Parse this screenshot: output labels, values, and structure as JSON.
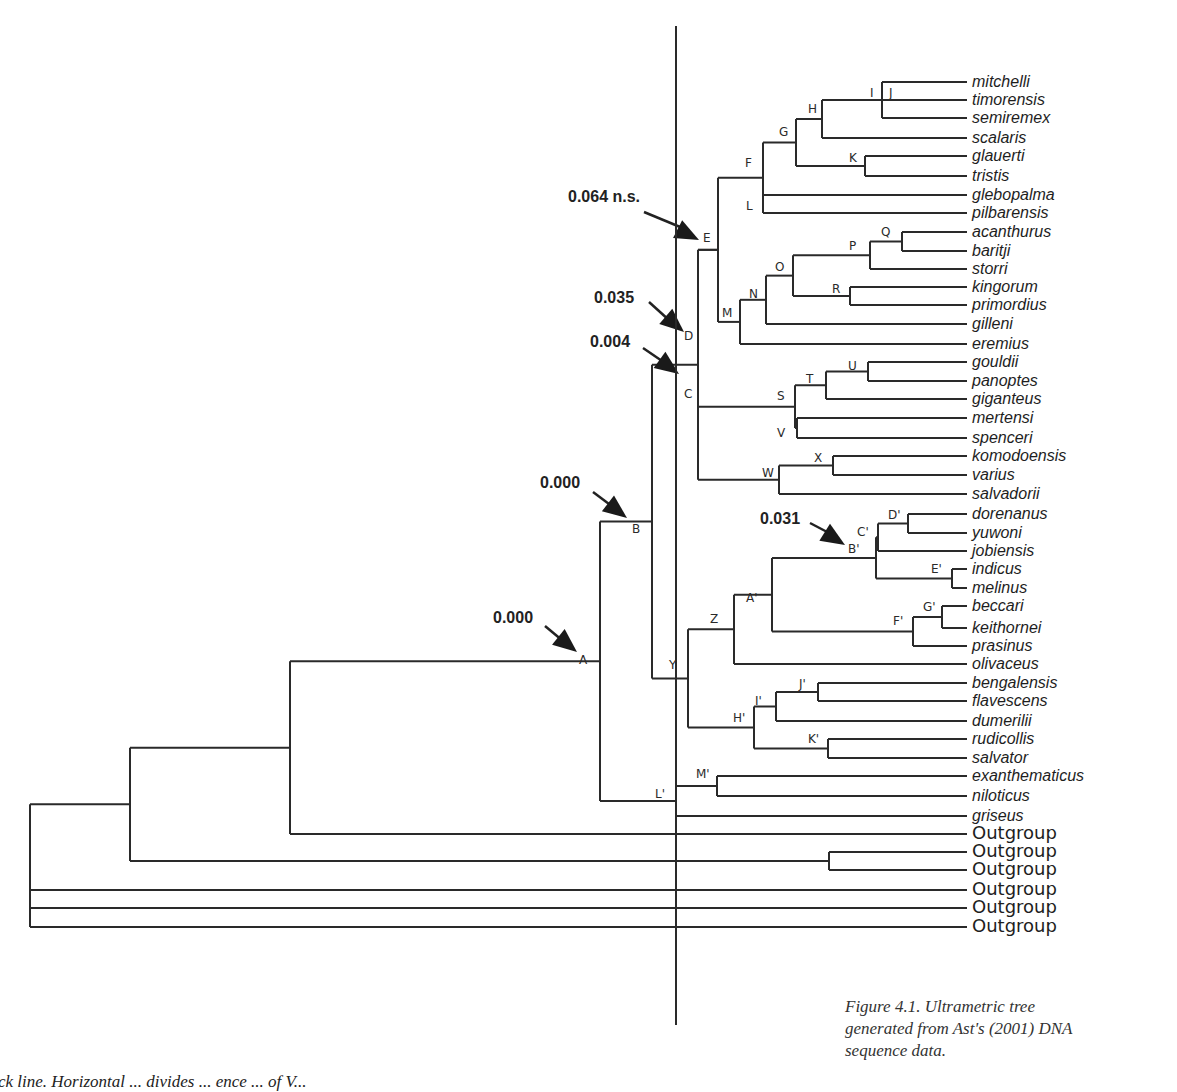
{
  "figure": {
    "caption": "Figure 4.1. Ultrametric tree generated from Ast's (2001) DNA sequence data.",
    "caption_lines": [
      "Figure 4.1. Ultrametric tree",
      "generated from Ast's (2001) DNA",
      "sequence data."
    ],
    "bottom_text": "ck line. Horizontal ... divides ... ence ... of V..."
  },
  "tree": {
    "leaf_x_end": 967,
    "label_x": 972,
    "cut_line": {
      "x": 676,
      "y1": 26,
      "y2": 1025
    },
    "leaves": [
      {
        "id": "mitchelli",
        "label": "mitchelli",
        "y": 82
      },
      {
        "id": "timorensis",
        "label": "timorensis",
        "y": 100
      },
      {
        "id": "semiremex",
        "label": "semiremex",
        "y": 118
      },
      {
        "id": "scalaris",
        "label": "scalaris",
        "y": 138
      },
      {
        "id": "glauerti",
        "label": "glauerti",
        "y": 156
      },
      {
        "id": "tristis",
        "label": "tristis",
        "y": 176
      },
      {
        "id": "glebopalma",
        "label": "glebopalma",
        "y": 195
      },
      {
        "id": "pilbarensis",
        "label": "pilbarensis",
        "y": 213
      },
      {
        "id": "acanthurus",
        "label": "acanthurus",
        "y": 232
      },
      {
        "id": "baritji",
        "label": "baritji",
        "y": 251
      },
      {
        "id": "storri",
        "label": "storri",
        "y": 269
      },
      {
        "id": "kingorum",
        "label": "kingorum",
        "y": 287
      },
      {
        "id": "primordius",
        "label": "primordius",
        "y": 305
      },
      {
        "id": "gilleni",
        "label": "gilleni",
        "y": 324
      },
      {
        "id": "eremius",
        "label": "eremius",
        "y": 344
      },
      {
        "id": "gouldii",
        "label": "gouldii",
        "y": 362
      },
      {
        "id": "panoptes",
        "label": "panoptes",
        "y": 381
      },
      {
        "id": "giganteus",
        "label": "giganteus",
        "y": 399
      },
      {
        "id": "mertensi",
        "label": "mertensi",
        "y": 418
      },
      {
        "id": "spenceri",
        "label": "spenceri",
        "y": 438
      },
      {
        "id": "komodoensis",
        "label": "komodoensis",
        "y": 456
      },
      {
        "id": "varius",
        "label": "varius",
        "y": 475
      },
      {
        "id": "salvadorii",
        "label": "salvadorii",
        "y": 494
      },
      {
        "id": "dorenanus",
        "label": "dorenanus",
        "y": 514
      },
      {
        "id": "yuwoni",
        "label": "yuwoni",
        "y": 533
      },
      {
        "id": "jobiensis",
        "label": "jobiensis",
        "y": 551
      },
      {
        "id": "indicus",
        "label": "indicus",
        "y": 569
      },
      {
        "id": "melinus",
        "label": "melinus",
        "y": 588
      },
      {
        "id": "beccari",
        "label": "beccari",
        "y": 606
      },
      {
        "id": "keithornei",
        "label": "keithornei",
        "y": 628
      },
      {
        "id": "prasinus",
        "label": "prasinus",
        "y": 646
      },
      {
        "id": "olivaceus",
        "label": "olivaceus",
        "y": 664
      },
      {
        "id": "bengalensis",
        "label": "bengalensis",
        "y": 683
      },
      {
        "id": "flavescens",
        "label": "flavescens",
        "y": 701
      },
      {
        "id": "dumerilii",
        "label": "dumerilii",
        "y": 721
      },
      {
        "id": "rudicollis",
        "label": "rudicollis",
        "y": 739
      },
      {
        "id": "salvator",
        "label": "salvator",
        "y": 758
      },
      {
        "id": "exanthematicus",
        "label": "exanthematicus",
        "y": 776
      },
      {
        "id": "niloticus",
        "label": "niloticus",
        "y": 796
      },
      {
        "id": "griseus",
        "label": "griseus",
        "y": 816
      },
      {
        "id": "og1",
        "label": "Outgroup",
        "y": 834,
        "outgroup": true
      },
      {
        "id": "og2",
        "label": "Outgroup",
        "y": 852,
        "outgroup": true
      },
      {
        "id": "og3",
        "label": "Outgroup",
        "y": 870,
        "outgroup": true
      },
      {
        "id": "og4",
        "label": "Outgroup",
        "y": 890,
        "outgroup": true
      },
      {
        "id": "og5",
        "label": "Outgroup",
        "y": 908,
        "outgroup": true
      },
      {
        "id": "og6",
        "label": "Outgroup",
        "y": 927,
        "outgroup": true
      }
    ],
    "nodes": [
      {
        "id": "J",
        "x": 882,
        "children": [
          "mitchelli",
          "timorensis",
          "semiremex"
        ],
        "label": "J",
        "lx": 889,
        "ly": 97
      },
      {
        "id": "I",
        "x": 882,
        "label": "I",
        "lx": 870,
        "ly": 97,
        "virtual": true
      },
      {
        "id": "H",
        "x": 822,
        "children": [
          "J",
          "scalaris"
        ],
        "label": "H",
        "lx": 808,
        "ly": 113
      },
      {
        "id": "K",
        "x": 865,
        "children": [
          "glauerti",
          "tristis"
        ],
        "label": "K",
        "lx": 849,
        "ly": 162
      },
      {
        "id": "G",
        "x": 796,
        "children": [
          "H",
          "K"
        ],
        "label": "G",
        "lx": 779,
        "ly": 136
      },
      {
        "id": "L",
        "x": 763,
        "children": [
          "glebopalma",
          "pilbarensis"
        ],
        "label": "L",
        "lx": 746,
        "ly": 210,
        "offset": true
      },
      {
        "id": "F",
        "x": 763,
        "children": [
          "G",
          "glebopalma",
          "pilbarensis"
        ],
        "label": "F",
        "lx": 745,
        "ly": 167
      },
      {
        "id": "Q",
        "x": 902,
        "children": [
          "acanthurus",
          "baritji"
        ],
        "label": "Q",
        "lx": 881,
        "ly": 236
      },
      {
        "id": "P",
        "x": 870,
        "children": [
          "Q",
          "storri"
        ],
        "label": "P",
        "lx": 849,
        "ly": 250
      },
      {
        "id": "R",
        "x": 850,
        "children": [
          "kingorum",
          "primordius"
        ],
        "label": "R",
        "lx": 832,
        "ly": 293
      },
      {
        "id": "O",
        "x": 793,
        "children": [
          "P",
          "R"
        ],
        "label": "O",
        "lx": 775,
        "ly": 271
      },
      {
        "id": "N",
        "x": 766,
        "children": [
          "O",
          "gilleni"
        ],
        "label": "N",
        "lx": 749,
        "ly": 298
      },
      {
        "id": "M",
        "x": 740,
        "children": [
          "N",
          "eremius"
        ],
        "label": "M",
        "lx": 722,
        "ly": 317
      },
      {
        "id": "E",
        "x": 718,
        "children": [
          "F",
          "M"
        ],
        "label": "E",
        "lx": 703,
        "ly": 242
      },
      {
        "id": "D",
        "x": 698,
        "children": [
          "E"
        ],
        "label": "D",
        "lx": 684,
        "ly": 340,
        "virtual": true
      },
      {
        "id": "U",
        "x": 868,
        "children": [
          "gouldii",
          "panoptes"
        ],
        "label": "U",
        "lx": 848,
        "ly": 370
      },
      {
        "id": "T",
        "x": 826,
        "children": [
          "U",
          "giganteus"
        ],
        "label": "T",
        "lx": 806,
        "ly": 383
      },
      {
        "id": "V",
        "x": 797,
        "children": [
          "mertensi",
          "spenceri"
        ],
        "label": "V",
        "lx": 777,
        "ly": 437
      },
      {
        "id": "S",
        "x": 795,
        "children": [
          "T",
          "V"
        ],
        "label": "S",
        "lx": 777,
        "ly": 400
      },
      {
        "id": "X",
        "x": 833,
        "children": [
          "komodoensis",
          "varius"
        ],
        "label": "X",
        "lx": 814,
        "ly": 462
      },
      {
        "id": "W",
        "x": 779,
        "children": [
          "X",
          "salvadorii"
        ],
        "label": "W",
        "lx": 762,
        "ly": 477
      },
      {
        "id": "C",
        "x": 698,
        "children": [
          "E",
          "S",
          "W"
        ],
        "label": "C",
        "lx": 684,
        "ly": 398
      },
      {
        "id": "D'",
        "x": 908,
        "children": [
          "dorenanus",
          "yuwoni"
        ],
        "label": "D'",
        "lx": 888,
        "ly": 519
      },
      {
        "id": "C'",
        "x": 878,
        "children": [
          "D'",
          "jobiensis"
        ],
        "label": "C'",
        "lx": 857,
        "ly": 536
      },
      {
        "id": "E'",
        "x": 952,
        "children": [
          "indicus",
          "melinus"
        ],
        "label": "E'",
        "lx": 931,
        "ly": 573
      },
      {
        "id": "B'",
        "x": 876,
        "children": [
          "C'",
          "E'"
        ],
        "label": "B'",
        "lx": 848,
        "ly": 553
      },
      {
        "id": "G'",
        "x": 942,
        "children": [
          "beccari",
          "keithornei"
        ],
        "label": "G'",
        "lx": 923,
        "ly": 611
      },
      {
        "id": "F'",
        "x": 913,
        "children": [
          "G'",
          "prasinus"
        ],
        "label": "F'",
        "lx": 893,
        "ly": 625
      },
      {
        "id": "A'",
        "x": 772,
        "children": [
          "B'",
          "F'"
        ],
        "label": "A'",
        "lx": 746,
        "ly": 602
      },
      {
        "id": "Z",
        "x": 734,
        "children": [
          "A'",
          "olivaceus"
        ],
        "label": "Z",
        "lx": 710,
        "ly": 623
      },
      {
        "id": "J'",
        "x": 818,
        "children": [
          "bengalensis",
          "flavescens"
        ],
        "label": "J'",
        "lx": 799,
        "ly": 688
      },
      {
        "id": "I'",
        "x": 776,
        "children": [
          "J'",
          "dumerilii"
        ],
        "label": "I'",
        "lx": 755,
        "ly": 705
      },
      {
        "id": "K'",
        "x": 828,
        "children": [
          "rudicollis",
          "salvator"
        ],
        "label": "K'",
        "lx": 808,
        "ly": 743
      },
      {
        "id": "H'",
        "x": 754,
        "children": [
          "I'",
          "K'"
        ],
        "label": "H'",
        "lx": 733,
        "ly": 722
      },
      {
        "id": "Y",
        "x": 688,
        "children": [
          "Z",
          "H'"
        ],
        "label": "Y",
        "lx": 669,
        "ly": 669
      },
      {
        "id": "B",
        "x": 652,
        "children": [
          "C",
          "Y"
        ],
        "label": "B",
        "lx": 632,
        "ly": 533
      },
      {
        "id": "M'",
        "x": 717,
        "children": [
          "exanthematicus",
          "niloticus"
        ],
        "label": "M'",
        "lx": 696,
        "ly": 778
      },
      {
        "id": "L'",
        "x": 676,
        "children": [
          "M'",
          "griseus"
        ],
        "label": "L'",
        "lx": 655,
        "ly": 798
      },
      {
        "id": "A",
        "x": 600,
        "children": [
          "B",
          "L'"
        ],
        "label": "A",
        "lx": 579,
        "ly": 664
      },
      {
        "id": "OGA",
        "x": 829,
        "children": [
          "og2",
          "og3"
        ]
      },
      {
        "id": "R1",
        "x": 290,
        "children": [
          "A",
          "og1"
        ]
      },
      {
        "id": "R2",
        "x": 130,
        "children": [
          "R1",
          "OGA"
        ]
      },
      {
        "id": "ROOT",
        "x": 30,
        "children": [
          "R2",
          "og4",
          "og5",
          "og6"
        ]
      }
    ],
    "annotations": [
      {
        "id": "ann-E",
        "text": "0.064 n.s.",
        "tx": 568,
        "ty": 202,
        "ax1": 644,
        "ay1": 212,
        "ax2": 699,
        "ay2": 240
      },
      {
        "id": "ann-D",
        "text": "0.035",
        "tx": 594,
        "ty": 303,
        "ax1": 649,
        "ay1": 302,
        "ax2": 684,
        "ay2": 332
      },
      {
        "id": "ann-C",
        "text": "0.004",
        "tx": 590,
        "ty": 347,
        "ax1": 643,
        "ay1": 348,
        "ax2": 679,
        "ay2": 374
      },
      {
        "id": "ann-B",
        "text": "0.000",
        "tx": 540,
        "ty": 488,
        "ax1": 593,
        "ay1": 492,
        "ax2": 627,
        "ay2": 518
      },
      {
        "id": "ann-A",
        "text": "0.000",
        "tx": 493,
        "ty": 623,
        "ax1": 545,
        "ay1": 626,
        "ax2": 577,
        "ay2": 652
      },
      {
        "id": "ann-Bp",
        "text": "0.031",
        "tx": 760,
        "ty": 524,
        "ax1": 810,
        "ay1": 523,
        "ax2": 845,
        "ay2": 545
      }
    ]
  },
  "colors": {
    "line": "#2a2a2a",
    "text": "#1e1e1e",
    "background": "#ffffff"
  }
}
